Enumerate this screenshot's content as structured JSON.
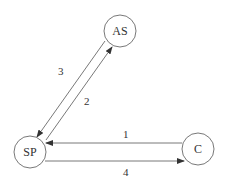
{
  "diagram": {
    "nodes": [
      {
        "id": "AS",
        "label": "AS",
        "cx": 120,
        "cy": 31,
        "r": 16
      },
      {
        "id": "SP",
        "label": "SP",
        "cx": 30,
        "cy": 152,
        "r": 16
      },
      {
        "id": "C",
        "label": "C",
        "cx": 198,
        "cy": 149,
        "r": 16
      }
    ],
    "edges": [
      {
        "id": "1",
        "label": "1",
        "from": "C",
        "to": "SP"
      },
      {
        "id": "2",
        "label": "2",
        "from": "SP",
        "to": "AS"
      },
      {
        "id": "3",
        "label": "3",
        "from": "AS",
        "to": "SP"
      },
      {
        "id": "4",
        "label": "4",
        "from": "SP",
        "to": "C"
      }
    ],
    "colors": {
      "stroke": "#555555",
      "text": "#333333",
      "background": "#ffffff"
    }
  }
}
